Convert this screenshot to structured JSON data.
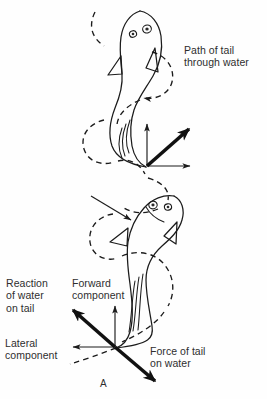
{
  "figure": {
    "domain": "Diagram",
    "panel_label": "A",
    "background_color": "#fefefe",
    "ink_color": "#1b1b1b"
  },
  "labels": {
    "path_of_tail": "Path of tail\nthrough water",
    "reaction_of_water": "Reaction\nof water\non tail",
    "forward_component": "Forward\ncomponent",
    "lateral_component": "Lateral\ncomponent",
    "force_of_tail": "Force of tail\non water"
  },
  "vectors": {
    "upper": [
      {
        "name": "forward-component",
        "style": "thin",
        "from": [
          147,
          166
        ],
        "to": [
          147,
          121
        ]
      },
      {
        "name": "lateral-component",
        "style": "thin",
        "from": [
          147,
          166
        ],
        "to": [
          193,
          166
        ]
      },
      {
        "name": "resultant-reaction",
        "style": "thick",
        "from": [
          147,
          166
        ],
        "to": [
          196,
          122
        ]
      }
    ],
    "lower": [
      {
        "name": "forward-component",
        "style": "thin",
        "from": [
          115,
          347
        ],
        "to": [
          115,
          303
        ]
      },
      {
        "name": "lateral-component",
        "style": "thin",
        "from": [
          115,
          347
        ],
        "to": [
          70,
          347
        ]
      },
      {
        "name": "reaction-of-water-on-tail",
        "style": "thick",
        "from": [
          115,
          347
        ],
        "to": [
          66,
          303
        ]
      },
      {
        "name": "force-of-tail-on-water",
        "style": "thick",
        "from": [
          115,
          347
        ],
        "to": [
          162,
          388
        ]
      }
    ],
    "body_pointer": {
      "name": "body-direction-pointer",
      "style": "thin",
      "from": [
        91,
        196
      ],
      "to": [
        135,
        222
      ]
    }
  },
  "elements": {
    "fish_count": 2,
    "dashed_path_name": "tail-path-through-water",
    "dashed_path_description": "sinusoidal dashed curve tracing the tail tip path"
  }
}
